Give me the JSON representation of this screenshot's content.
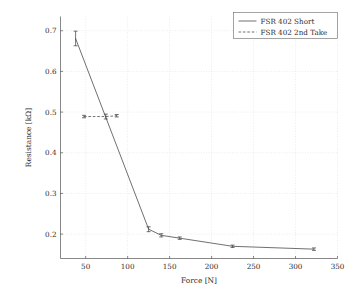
{
  "chart_data": {
    "type": "line",
    "title": "",
    "xlabel": "Force [N]",
    "ylabel": "Resistance [kΩ]",
    "xlim": [
      20,
      350
    ],
    "ylim": [
      0.14,
      0.735
    ],
    "grid": true,
    "legend_position": "top-right",
    "xticks": [
      50,
      100,
      150,
      200,
      250,
      300,
      350
    ],
    "xtick_labels": [
      "50",
      "100",
      "150",
      "200",
      "250",
      "300",
      "350"
    ],
    "yticks": [
      0.2,
      0.3,
      0.4,
      0.5,
      0.6,
      0.7
    ],
    "ytick_labels": [
      "0.2",
      "0.3",
      "0.4",
      "0.5",
      "0.6",
      "0.7"
    ],
    "series": [
      {
        "name": "FSR 402 Short",
        "style": "solid",
        "marker": "error-bar",
        "x": [
          38,
          125,
          140,
          162,
          225,
          322
        ],
        "y": [
          0.681,
          0.212,
          0.197,
          0.19,
          0.17,
          0.163
        ],
        "yerr": [
          0.018,
          0.006,
          0.004,
          0.003,
          0.003,
          0.003
        ]
      },
      {
        "name": "FSR 402 2nd Take",
        "style": "dashed",
        "marker": "error-bar",
        "x": [
          48,
          74,
          87
        ],
        "y": [
          0.489,
          0.489,
          0.491
        ],
        "yerr": [
          0.003,
          0.006,
          0.003
        ]
      }
    ]
  },
  "legend": {
    "entries": [
      {
        "label": "FSR 402 Short",
        "style": "solid"
      },
      {
        "label": "FSR 402 2nd Take",
        "style": "dashed"
      }
    ]
  },
  "axes": {
    "x_title": "Force [N]",
    "y_title": "Resistance [kΩ]"
  },
  "colors": {
    "line": "#4b4b4b",
    "grid": "#d9d9d9",
    "frame": "#555555",
    "text": "#2b2b2b",
    "background": "#ffffff"
  }
}
